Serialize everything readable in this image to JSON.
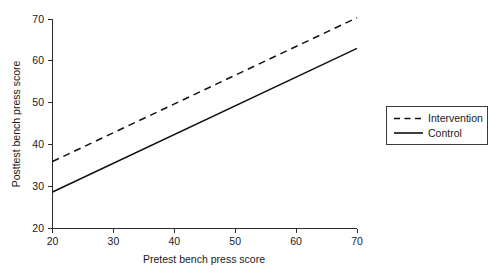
{
  "chart_data": {
    "type": "line",
    "title": "",
    "xlabel": "Pretest bench press score",
    "ylabel": "Posttest bench press score",
    "xlim": [
      20,
      70
    ],
    "ylim": [
      20,
      70
    ],
    "xticks": [
      20,
      30,
      40,
      50,
      60,
      70
    ],
    "yticks": [
      20,
      30,
      40,
      50,
      60,
      70
    ],
    "xtick_labels": [
      "20",
      "30",
      "40",
      "50",
      "60",
      "70"
    ],
    "ytick_labels": [
      "20",
      "30",
      "40",
      "50",
      "60",
      "70"
    ],
    "grid": false,
    "legend_position": "right-outside",
    "x": [
      20,
      70
    ],
    "series": [
      {
        "name": "Intervention",
        "style": "dashed",
        "color": "#111111",
        "values": [
          36.0,
          70.3
        ]
      },
      {
        "name": "Control",
        "style": "solid",
        "color": "#111111",
        "values": [
          28.7,
          63.0
        ]
      }
    ]
  },
  "legend": {
    "entries": [
      {
        "label": "Intervention",
        "style": "dashed"
      },
      {
        "label": "Control",
        "style": "solid"
      }
    ]
  },
  "axes": {
    "x_title": "Pretest bench press score",
    "y_title": "Posttest bench press score"
  }
}
